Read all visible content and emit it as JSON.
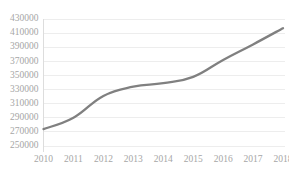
{
  "chart_data": {
    "type": "line",
    "title": "",
    "subtitle": "",
    "xlabel": "",
    "ylabel": "",
    "categories": [
      "2010",
      "2011",
      "2012",
      "2013",
      "2014",
      "2015",
      "2016",
      "2017",
      "2018"
    ],
    "x": [
      2010,
      2011,
      2012,
      2013,
      2014,
      2015,
      2016,
      2017,
      2018
    ],
    "values": [
      274000,
      290000,
      321000,
      334000,
      339000,
      348000,
      372000,
      394000,
      417000
    ],
    "series": [
      {
        "name": "",
        "values": [
          274000,
          290000,
          321000,
          334000,
          339000,
          348000,
          372000,
          394000,
          417000
        ],
        "color": "#808080",
        "smooth": true,
        "line_width": 2.3,
        "markers": false
      }
    ],
    "ylim": [
      250000,
      430000
    ],
    "ytick_step": 20000,
    "yticks": [
      250000,
      270000,
      290000,
      310000,
      330000,
      350000,
      370000,
      390000,
      410000,
      430000
    ],
    "ytick_labels": [
      "250000",
      "270000",
      "290000",
      "310000",
      "330000",
      "350000",
      "370000",
      "390000",
      "410000",
      "430000"
    ],
    "xticks": [
      "2010",
      "2011",
      "2012",
      "2013",
      "2014",
      "2015",
      "2016",
      "2017",
      "2018"
    ],
    "grid": {
      "horizontal": true,
      "vertical": false,
      "color": "#e8e8e8"
    },
    "legend": {
      "visible": false,
      "position": "none",
      "entries": []
    },
    "annotations": [],
    "axis": {
      "y_axis_line": true,
      "x_axis_line": false,
      "tick_label_color": "#a6a6a6"
    },
    "plot_background": "#ffffff"
  }
}
